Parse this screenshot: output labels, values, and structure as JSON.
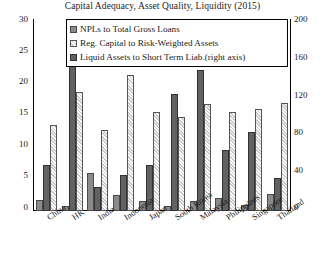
{
  "chart_data": {
    "type": "bar",
    "title": "Capital Adequacy, Asset Quality, Liquidity (2015)",
    "xlabel": "",
    "ylabel": "",
    "ylim": [
      0,
      30
    ],
    "y2lim": [
      0,
      200
    ],
    "grid": false,
    "legend_position": "top-center",
    "categories": [
      "China",
      "HK",
      "India",
      "Indonesia",
      "Japan",
      "South Korea",
      "Malaysia",
      "Philippines",
      "Singapore",
      "Thailand"
    ],
    "y_ticks": [
      "0",
      "5",
      "10",
      "15",
      "20",
      "25",
      "30"
    ],
    "y2_ticks": [
      "0",
      "40",
      "80",
      "120",
      "160",
      "200"
    ],
    "series": [
      {
        "name": "NPLs to Total Gross Loans",
        "axis": "left",
        "color": "#8a8a8a",
        "values": [
          1.7,
          0.8,
          5.9,
          2.5,
          1.5,
          0.8,
          1.6,
          2.1,
          1.0,
          2.7
        ]
      },
      {
        "name": "Liquid Assets to Short Term Liab.(right axis)",
        "axis": "right",
        "color": "#626262",
        "values": [
          48,
          165,
          25,
          38,
          48,
          123,
          148,
          64,
          83,
          35
        ]
      },
      {
        "name": "Reg. Capital to Risk-Weighted Assets",
        "axis": "left",
        "color": "#ececec",
        "values": [
          13.5,
          18.7,
          12.7,
          21.4,
          15.6,
          14.8,
          16.8,
          15.5,
          16.1,
          17.0
        ]
      }
    ]
  },
  "legend": {
    "items": [
      {
        "label": "NPLs to Total Gross Loans",
        "swatch": "npl"
      },
      {
        "label": "Reg. Capital to Risk-Weighted Assets",
        "swatch": "cap"
      },
      {
        "label": "Liquid Assets to Short Term Liab.(right axis)",
        "swatch": "liq"
      }
    ]
  }
}
